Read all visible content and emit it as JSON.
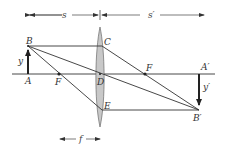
{
  "figure": {
    "colors": {
      "line": "#333333",
      "lens_fill": "#c8c8c8",
      "background": "#ffffff"
    }
  },
  "dimensions": {
    "s": "s",
    "s_prime": "s′",
    "f": "f"
  },
  "points": {
    "B": "B",
    "A": "A",
    "C": "C",
    "D": "D",
    "E": "E",
    "F_left": "F",
    "F_right": "F",
    "A_prime": "A′",
    "B_prime": "B′"
  },
  "heights": {
    "object": "y",
    "image": "y′"
  }
}
